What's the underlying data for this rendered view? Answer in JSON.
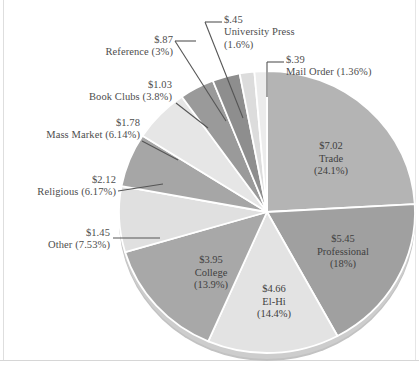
{
  "chart_data": {
    "type": "pie",
    "title": "",
    "subtitle": "",
    "xlabel": "",
    "ylabel": "",
    "legend_position": "none",
    "grid": false,
    "value_prefix": "$",
    "value_unit": "billions",
    "categories": [
      "Trade",
      "Professional",
      "El-Hi",
      "College",
      "Other",
      "Religious",
      "Mass Market",
      "Book Clubs",
      "Reference",
      "University Press",
      "Mail Order"
    ],
    "values": [
      7.02,
      5.45,
      4.66,
      3.95,
      1.45,
      2.12,
      1.78,
      1.03,
      0.87,
      0.45,
      0.39
    ],
    "percentages": [
      24.1,
      18.0,
      14.4,
      13.9,
      7.53,
      6.17,
      6.14,
      3.8,
      3.0,
      1.6,
      1.36
    ],
    "slices": [
      {
        "name": "Trade",
        "value_label": "$7.02",
        "percent_label": "(24.1%)",
        "value": 7.02,
        "percent": 24.1,
        "color": "#b4b4b4",
        "label_placement": "inside"
      },
      {
        "name": "Professional",
        "value_label": "$5.45",
        "percent_label": "(18%)",
        "value": 5.45,
        "percent": 18.0,
        "color": "#a0a0a0",
        "label_placement": "inside"
      },
      {
        "name": "El-Hi",
        "value_label": "$4.66",
        "percent_label": "(14.4%)",
        "value": 4.66,
        "percent": 14.4,
        "color": "#e3e3e3",
        "label_placement": "inside"
      },
      {
        "name": "College",
        "value_label": "$3.95",
        "percent_label": "(13.9%)",
        "value": 3.95,
        "percent": 13.9,
        "color": "#a8a8a8",
        "label_placement": "inside"
      },
      {
        "name": "Other",
        "value_label": "$1.45",
        "percent_label": "(7.53%)",
        "value": 1.45,
        "percent": 7.53,
        "color": "#e0e0e0",
        "label_placement": "outside"
      },
      {
        "name": "Religious",
        "value_label": "$2.12",
        "percent_label": "(6.17%)",
        "value": 2.12,
        "percent": 6.17,
        "color": "#a6a6a6",
        "label_placement": "outside"
      },
      {
        "name": "Mass Market",
        "value_label": "$1.78",
        "percent_label": "(6.14%)",
        "value": 1.78,
        "percent": 6.14,
        "color": "#e6e6e6",
        "label_placement": "outside"
      },
      {
        "name": "Book Clubs",
        "value_label": "$1.03",
        "percent_label": "(3.8%)",
        "value": 1.03,
        "percent": 3.8,
        "color": "#9a9a9a",
        "label_placement": "outside"
      },
      {
        "name": "Reference",
        "value_label": "$.87",
        "percent_label": "(3%)",
        "value": 0.87,
        "percent": 3.0,
        "color": "#8e8e8e",
        "label_placement": "outside"
      },
      {
        "name": "University Press",
        "value_label": "$.45",
        "percent_label": "(1.6%)",
        "value": 0.45,
        "percent": 1.6,
        "color": "#dcdcdc",
        "label_placement": "outside"
      },
      {
        "name": "Mail Order",
        "value_label": "$.39",
        "percent_label": "(1.36%)",
        "value": 0.39,
        "percent": 1.36,
        "color": "#ececec",
        "label_placement": "outside"
      }
    ]
  },
  "labels": {
    "university_press": {
      "value": "$.45",
      "name": "University Press",
      "percent": "(1.6%)"
    },
    "reference": {
      "value": "$.87",
      "name_percent": "Reference (3%)"
    },
    "mail_order": {
      "value": "$.39",
      "name_percent": "Mail Order (1.36%)"
    },
    "book_clubs": {
      "value": "$1.03",
      "name_percent": "Book Clubs (3.8%)"
    },
    "mass_market": {
      "value": "$1.78",
      "name_percent": "Mass Market (6.14%)"
    },
    "religious": {
      "value": "$2.12",
      "name_percent": "Religious (6.17%)"
    },
    "other": {
      "value": "$1.45",
      "name_percent": "Other (7.53%)"
    },
    "trade": {
      "value": "$7.02",
      "name": "Trade",
      "percent": "(24.1%)"
    },
    "professional": {
      "value": "$5.45",
      "name": "Professional",
      "percent": "(18%)"
    },
    "elhi": {
      "value": "$4.66",
      "name": "El-Hi",
      "percent": "(14.4%)"
    },
    "college": {
      "value": "$3.95",
      "name": "College",
      "percent": "(13.9%)"
    }
  },
  "colors": {
    "light_slice": "#e6e6e6",
    "dark_slice": "#a6a6a6",
    "separator": "#ffffff",
    "text": "#4d4d4d",
    "frame": "#dedede"
  }
}
